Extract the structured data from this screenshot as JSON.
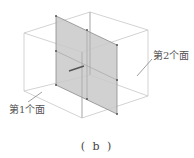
{
  "figure": {
    "caption": "( b )",
    "labels": {
      "face1": "第1个面",
      "face2": "第2个面"
    },
    "colors": {
      "box_edge": "#c8c8c8",
      "plane_fill": "#c9c9c9",
      "plane_edge": "#8a8a8a",
      "vertex": "#555555",
      "text": "#555555"
    }
  }
}
